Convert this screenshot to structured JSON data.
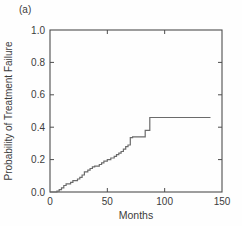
{
  "panel_label": "(a)",
  "chart_data": {
    "type": "line",
    "subtype": "step-post",
    "title": "",
    "xlabel": "Months",
    "ylabel": "Probability of Treatment Failure",
    "xlim": [
      0,
      150
    ],
    "ylim": [
      0.0,
      1.0
    ],
    "xticks": [
      0,
      50,
      100,
      150
    ],
    "yticks": [
      0.0,
      0.2,
      0.4,
      0.6,
      0.8,
      1.0
    ],
    "grid": false,
    "legend": "none",
    "axis_color": "#4d4d4d",
    "line_color": "#6b6b6b",
    "text_color": "#3c3c3c",
    "series": [
      {
        "name": "cumulative-probability-of-treatment-failure",
        "x": [
          0,
          6,
          8,
          10,
          12,
          14,
          18,
          20,
          24,
          26,
          28,
          30,
          33,
          35,
          37,
          39,
          43,
          45,
          47,
          50,
          53,
          56,
          58,
          60,
          62,
          64,
          66,
          68,
          70,
          72,
          83,
          87,
          140
        ],
        "y": [
          0.0,
          0.005,
          0.015,
          0.025,
          0.04,
          0.05,
          0.06,
          0.07,
          0.08,
          0.09,
          0.105,
          0.125,
          0.135,
          0.145,
          0.155,
          0.16,
          0.17,
          0.18,
          0.19,
          0.2,
          0.21,
          0.22,
          0.23,
          0.24,
          0.25,
          0.265,
          0.28,
          0.29,
          0.335,
          0.34,
          0.38,
          0.46,
          0.46
        ]
      }
    ]
  }
}
